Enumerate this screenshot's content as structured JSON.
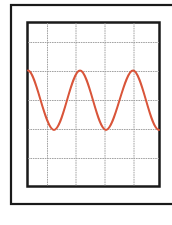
{
  "figure": {
    "colors": {
      "background": "#ffffff",
      "frame": "#1a1a1a",
      "grid": "#9a9a9a",
      "wave": "#d9553a"
    },
    "screen": {
      "columns": 5,
      "rows": 6
    },
    "waveform": {
      "type": "sine",
      "cycles_visible": 2.5,
      "amplitude_divisions": 1,
      "center_row_line": 3
    }
  }
}
